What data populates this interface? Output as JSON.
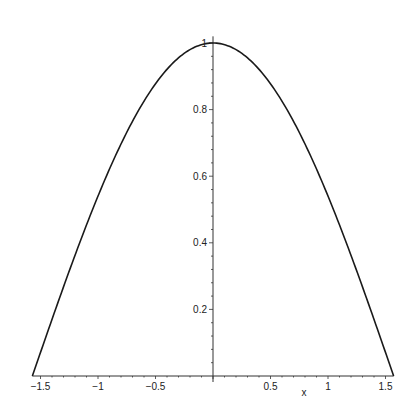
{
  "chart_data": {
    "type": "line",
    "title": "",
    "function": "cos(x)",
    "xlabel": "x",
    "ylabel": "",
    "xlim": [
      -1.5708,
      1.5708
    ],
    "ylim": [
      0,
      1
    ],
    "grid": false,
    "legend": null,
    "x_ticks": [
      -1.5,
      -1,
      -0.5,
      0.5,
      1,
      1.5
    ],
    "x_tick_labels": [
      "-1.5",
      "-1",
      "-0.5",
      "0.5",
      "1",
      "1.5"
    ],
    "y_ticks": [
      0.2,
      0.4,
      0.6,
      0.8,
      1
    ],
    "y_tick_labels": [
      "0.2",
      "0.4",
      "0.6",
      "0.8",
      "1"
    ],
    "series": [
      {
        "name": "cos(x)",
        "x": [
          -1.5708,
          -1.25,
          -1.0,
          -0.75,
          -0.5,
          -0.25,
          0,
          0.25,
          0.5,
          0.75,
          1.0,
          1.25,
          1.5708
        ],
        "y": [
          0.0,
          0.315,
          0.54,
          0.732,
          0.878,
          0.969,
          1.0,
          0.969,
          0.878,
          0.732,
          0.54,
          0.315,
          0.0
        ]
      }
    ],
    "colors": {
      "line": "#1a1a1a",
      "axis": "#333333"
    }
  }
}
